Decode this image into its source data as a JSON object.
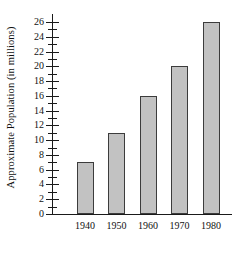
{
  "chart_data": {
    "type": "bar",
    "title": "",
    "subtitle": "",
    "xlabel": "",
    "ylabel": "Approximate Population (in millions)",
    "categories": [
      "1940",
      "1950",
      "1960",
      "1970",
      "1980"
    ],
    "values": [
      7,
      11,
      16,
      20,
      26
    ],
    "series": [
      {
        "name": "Approximate Population",
        "values": [
          7,
          11,
          16,
          20,
          26
        ]
      }
    ],
    "ylim": [
      0,
      26
    ],
    "ytick_labels": [
      "0",
      "2",
      "4",
      "6",
      "8",
      "10",
      "12",
      "14",
      "16",
      "18",
      "20",
      "22",
      "24",
      "26"
    ],
    "ytick_values": [
      0,
      2,
      4,
      6,
      8,
      10,
      12,
      14,
      16,
      18,
      20,
      22,
      24,
      26
    ],
    "yminor_tick_values": [
      1,
      3,
      5,
      7,
      9,
      11,
      13,
      15,
      17,
      19,
      21,
      23,
      25
    ],
    "ytick_step": 2,
    "grid": false,
    "legend": false,
    "legend_position": "none",
    "bar_fill_color": "#c2c2c2",
    "bar_border_color": "#3c3c3c",
    "axis_color": "#1a1a1a",
    "background_color": "#ffffff",
    "annotations": []
  }
}
